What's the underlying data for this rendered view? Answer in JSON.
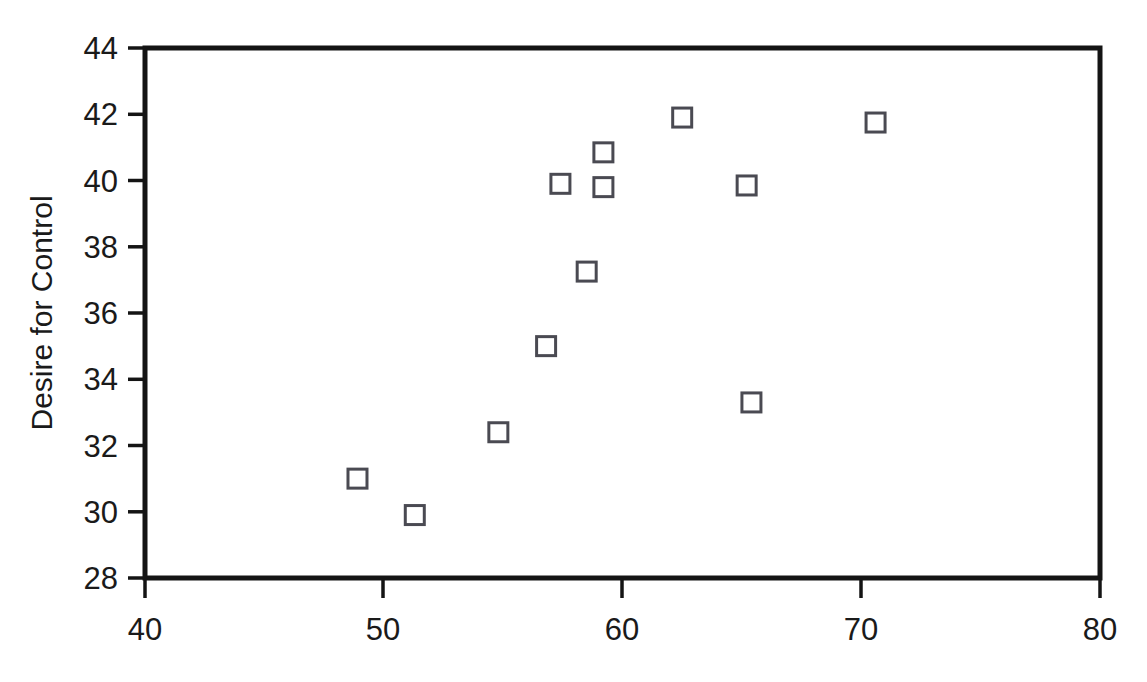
{
  "chart_data": {
    "type": "scatter",
    "title": "",
    "subtitle": "",
    "xlabel": "",
    "ylabel": "Desire for Control",
    "xlim": [
      40,
      80
    ],
    "ylim": [
      28,
      44
    ],
    "xticks": [
      40,
      50,
      60,
      70,
      80
    ],
    "yticks": [
      28,
      30,
      32,
      34,
      36,
      38,
      40,
      42,
      44
    ],
    "xtick_labels": [
      "40",
      "50",
      "60",
      "70",
      "80"
    ],
    "ytick_labels": [
      "28",
      "30",
      "32",
      "34",
      "36",
      "38",
      "40",
      "42",
      "44"
    ],
    "grid": false,
    "legend": null,
    "legend_position": "none",
    "marker": "open-square",
    "marker_color": "#4a4a52",
    "marker_fill": "none",
    "frame": true,
    "series": [
      {
        "name": "observations",
        "x": [
          48.9,
          51.3,
          54.8,
          56.8,
          57.4,
          58.5,
          59.2,
          59.2,
          62.5,
          65.2,
          65.4,
          70.6
        ],
        "y": [
          31.0,
          29.9,
          32.4,
          35.0,
          39.9,
          37.25,
          40.85,
          39.8,
          41.9,
          39.85,
          33.3,
          41.75
        ]
      }
    ],
    "points": [
      {
        "x": 48.9,
        "y": 31.0
      },
      {
        "x": 51.3,
        "y": 29.9
      },
      {
        "x": 54.8,
        "y": 32.4
      },
      {
        "x": 56.8,
        "y": 35.0
      },
      {
        "x": 57.4,
        "y": 39.9
      },
      {
        "x": 58.5,
        "y": 37.25
      },
      {
        "x": 59.2,
        "y": 40.85
      },
      {
        "x": 59.2,
        "y": 39.8
      },
      {
        "x": 62.5,
        "y": 41.9
      },
      {
        "x": 65.2,
        "y": 39.85
      },
      {
        "x": 65.4,
        "y": 33.3
      },
      {
        "x": 70.6,
        "y": 41.75
      }
    ],
    "n_points": 12
  },
  "style": {
    "background": "#ffffff",
    "axis_color": "#141414",
    "text_color": "#1a1a1a",
    "marker_stroke": "#4a4a52"
  }
}
